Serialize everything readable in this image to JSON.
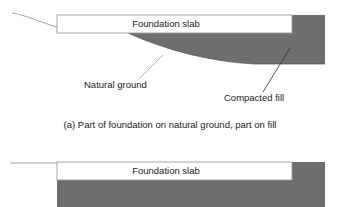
{
  "figure": {
    "background_color": "#ffffff",
    "fill_color": "#6e6e6e",
    "line_color": "#9a9a9a",
    "text_color": "#1a1a1a",
    "panels": [
      {
        "id": "panel-a",
        "slab_label": "Foundation slab",
        "annotations": [
          {
            "id": "natural-ground",
            "label": "Natural ground"
          },
          {
            "id": "compacted-fill",
            "label": "Compacted fill"
          }
        ],
        "caption": "(a) Part of foundation on natural ground, part on fill"
      },
      {
        "id": "panel-b",
        "slab_label": "Foundation slab",
        "annotations": [],
        "caption": ""
      }
    ]
  }
}
